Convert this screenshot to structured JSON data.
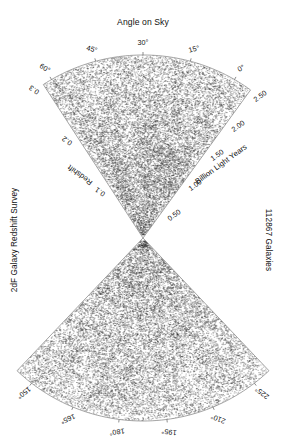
{
  "figure": {
    "title": "Angle on Sky",
    "left_caption": "2dF Galaxy Redshift Survey",
    "right_caption": "112867 Galaxies",
    "point_color": "#2b2b2b",
    "outline_color": "#8d8d8d"
  },
  "axes": {
    "redshift": {
      "name": "Redshift",
      "ticks": [
        "0.1",
        "0.2",
        "0.3"
      ]
    },
    "distance": {
      "name": "Billion Light Years",
      "ticks": [
        "0.50",
        "1.00",
        "1.50",
        "2.00",
        "2.50"
      ]
    }
  },
  "angles": {
    "top": [
      "0",
      "15",
      "30",
      "45",
      "60"
    ],
    "bottom": [
      "150",
      "165",
      "180",
      "195",
      "210",
      "225"
    ],
    "degree_symbol": "°"
  },
  "chart_data": {
    "type": "scatter",
    "title": "Angle on Sky",
    "subtitle": "2dF Galaxy Redshift Survey",
    "n_points": 112867,
    "projection": "polar-wedge-bowtie",
    "xlabel": "Angle on Sky",
    "ylabel": "Redshift / Billion Light Years",
    "legend": "none",
    "grid": false,
    "apex": {
      "x": 143,
      "y": 238
    },
    "radial_axis_primary": {
      "label": "Redshift",
      "ticks": [
        0.1,
        0.2,
        0.3
      ],
      "range": [
        0,
        0.3
      ],
      "side": "left"
    },
    "radial_axis_secondary": {
      "label": "Billion Light Years",
      "ticks": [
        0.5,
        1.0,
        1.5,
        2.0,
        2.5
      ],
      "range": [
        0,
        2.5
      ],
      "side": "right"
    },
    "angular_axis": {
      "label": "Angle on Sky",
      "units": "degrees",
      "top_wedge_ticks": [
        0,
        15,
        30,
        45,
        60
      ],
      "top_wedge_range": [
        -5,
        65
      ],
      "bottom_wedge_ticks": [
        150,
        165,
        180,
        195,
        210,
        225
      ],
      "bottom_wedge_range": [
        145,
        230
      ]
    },
    "density_description": "Filamentary large-scale structure; densest clustering near the apex at low redshift, thinning toward the outer arc.",
    "series": [
      {
        "name": "Northern strip galaxies",
        "wedge": "top",
        "approx_count": 56000
      },
      {
        "name": "Southern strip galaxies",
        "wedge": "bottom",
        "approx_count": 56867
      }
    ]
  }
}
